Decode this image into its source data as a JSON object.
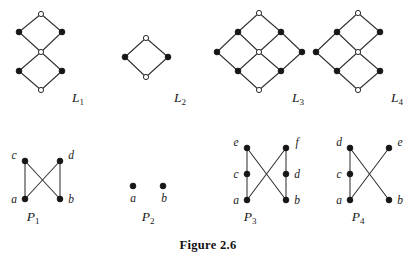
{
  "figure": {
    "caption": "Figure 2.6",
    "caption_x": 208,
    "caption_y": 249
  },
  "colors": {
    "filled_node": "#161616",
    "open_node_fill": "#ffffff",
    "open_node_stroke": "#2b2b2b",
    "edge": "#303030",
    "text": "#1a1a1a",
    "background": "#ffffff"
  },
  "diagrams": [
    {
      "id": "L1",
      "name": "lattice-l1",
      "label": {
        "base": "L",
        "sub": "1",
        "x": 78,
        "y": 102
      },
      "nodes": [
        {
          "id": "t",
          "x": 41,
          "y": 14,
          "type": "open"
        },
        {
          "id": "ul",
          "x": 19,
          "y": 32,
          "type": "filled"
        },
        {
          "id": "ur",
          "x": 62,
          "y": 32,
          "type": "filled"
        },
        {
          "id": "m",
          "x": 41,
          "y": 52,
          "type": "open"
        },
        {
          "id": "ll",
          "x": 19,
          "y": 71,
          "type": "filled"
        },
        {
          "id": "lr",
          "x": 62,
          "y": 71,
          "type": "filled"
        },
        {
          "id": "b",
          "x": 41,
          "y": 90,
          "type": "open"
        }
      ],
      "edges": [
        [
          "t",
          "ul"
        ],
        [
          "t",
          "ur"
        ],
        [
          "ul",
          "m"
        ],
        [
          "ur",
          "m"
        ],
        [
          "m",
          "ll"
        ],
        [
          "m",
          "lr"
        ],
        [
          "ll",
          "b"
        ],
        [
          "lr",
          "b"
        ]
      ],
      "vertex_labels": []
    },
    {
      "id": "L2",
      "name": "lattice-l2",
      "label": {
        "base": "L",
        "sub": "2",
        "x": 180,
        "y": 102
      },
      "nodes": [
        {
          "id": "t",
          "x": 146,
          "y": 38,
          "type": "open"
        },
        {
          "id": "l",
          "x": 125,
          "y": 57,
          "type": "filled"
        },
        {
          "id": "r",
          "x": 168,
          "y": 57,
          "type": "filled"
        },
        {
          "id": "b",
          "x": 146,
          "y": 77,
          "type": "open"
        }
      ],
      "edges": [
        [
          "t",
          "l"
        ],
        [
          "t",
          "r"
        ],
        [
          "l",
          "b"
        ],
        [
          "r",
          "b"
        ]
      ],
      "vertex_labels": []
    },
    {
      "id": "L3",
      "name": "lattice-l3",
      "label": {
        "base": "L",
        "sub": "3",
        "x": 298,
        "y": 102
      },
      "nodes": [
        {
          "id": "t",
          "x": 259,
          "y": 13,
          "type": "open"
        },
        {
          "id": "a1",
          "x": 238,
          "y": 32,
          "type": "filled"
        },
        {
          "id": "a2",
          "x": 281,
          "y": 32,
          "type": "filled"
        },
        {
          "id": "b1",
          "x": 217,
          "y": 52,
          "type": "filled"
        },
        {
          "id": "c",
          "x": 259,
          "y": 52,
          "type": "open"
        },
        {
          "id": "b2",
          "x": 302,
          "y": 52,
          "type": "filled"
        },
        {
          "id": "d1",
          "x": 238,
          "y": 71,
          "type": "filled"
        },
        {
          "id": "d2",
          "x": 281,
          "y": 71,
          "type": "filled"
        },
        {
          "id": "bt",
          "x": 259,
          "y": 90,
          "type": "open"
        }
      ],
      "edges": [
        [
          "t",
          "a1"
        ],
        [
          "t",
          "a2"
        ],
        [
          "a1",
          "b1"
        ],
        [
          "a1",
          "c"
        ],
        [
          "a2",
          "c"
        ],
        [
          "a2",
          "b2"
        ],
        [
          "b1",
          "d1"
        ],
        [
          "c",
          "d1"
        ],
        [
          "c",
          "d2"
        ],
        [
          "b2",
          "d2"
        ],
        [
          "d1",
          "bt"
        ],
        [
          "d2",
          "bt"
        ]
      ],
      "vertex_labels": []
    },
    {
      "id": "L4",
      "name": "lattice-l4",
      "label": {
        "base": "L",
        "sub": "4",
        "x": 397,
        "y": 102
      },
      "nodes": [
        {
          "id": "t",
          "x": 358,
          "y": 13,
          "type": "open"
        },
        {
          "id": "a1",
          "x": 337,
          "y": 32,
          "type": "filled"
        },
        {
          "id": "a2",
          "x": 380,
          "y": 32,
          "type": "filled"
        },
        {
          "id": "b1",
          "x": 316,
          "y": 52,
          "type": "filled"
        },
        {
          "id": "c",
          "x": 358,
          "y": 52,
          "type": "open"
        },
        {
          "id": "d1",
          "x": 337,
          "y": 71,
          "type": "filled"
        },
        {
          "id": "d2",
          "x": 380,
          "y": 71,
          "type": "filled"
        },
        {
          "id": "bt",
          "x": 358,
          "y": 90,
          "type": "open"
        }
      ],
      "edges": [
        [
          "t",
          "a1"
        ],
        [
          "t",
          "a2"
        ],
        [
          "a1",
          "b1"
        ],
        [
          "a1",
          "c"
        ],
        [
          "a2",
          "c"
        ],
        [
          "b1",
          "d1"
        ],
        [
          "c",
          "d1"
        ],
        [
          "c",
          "d2"
        ],
        [
          "d1",
          "bt"
        ],
        [
          "d2",
          "bt"
        ]
      ],
      "vertex_labels": []
    },
    {
      "id": "P1",
      "name": "poset-p1",
      "label": {
        "base": "P",
        "sub": "1",
        "x": 33,
        "y": 221
      },
      "nodes": [
        {
          "id": "c",
          "x": 25,
          "y": 161,
          "type": "filled"
        },
        {
          "id": "d",
          "x": 60,
          "y": 161,
          "type": "filled"
        },
        {
          "id": "a",
          "x": 25,
          "y": 199,
          "type": "filled"
        },
        {
          "id": "b",
          "x": 60,
          "y": 199,
          "type": "filled"
        }
      ],
      "edges": [
        [
          "a",
          "c"
        ],
        [
          "b",
          "d"
        ],
        [
          "a",
          "d"
        ],
        [
          "b",
          "c"
        ]
      ],
      "vertex_labels": [
        {
          "text": "c",
          "x": 14,
          "y": 159,
          "anchor": "middle"
        },
        {
          "text": "d",
          "x": 71,
          "y": 159,
          "anchor": "middle"
        },
        {
          "text": "a",
          "x": 14,
          "y": 203,
          "anchor": "middle"
        },
        {
          "text": "b",
          "x": 71,
          "y": 203,
          "anchor": "middle"
        }
      ]
    },
    {
      "id": "P2",
      "name": "poset-p2",
      "label": {
        "base": "P",
        "sub": "2",
        "x": 148,
        "y": 221
      },
      "nodes": [
        {
          "id": "a",
          "x": 133,
          "y": 186,
          "type": "filled"
        },
        {
          "id": "b",
          "x": 163,
          "y": 186,
          "type": "filled"
        }
      ],
      "edges": [],
      "vertex_labels": [
        {
          "text": "a",
          "x": 133,
          "y": 202,
          "anchor": "middle"
        },
        {
          "text": "b",
          "x": 164,
          "y": 202,
          "anchor": "middle"
        }
      ]
    },
    {
      "id": "P3",
      "name": "poset-p3",
      "label": {
        "base": "P",
        "sub": "3",
        "x": 250,
        "y": 221
      },
      "nodes": [
        {
          "id": "e",
          "x": 247,
          "y": 148,
          "type": "filled"
        },
        {
          "id": "f",
          "x": 286,
          "y": 148,
          "type": "filled"
        },
        {
          "id": "c",
          "x": 247,
          "y": 174,
          "type": "filled"
        },
        {
          "id": "d",
          "x": 286,
          "y": 174,
          "type": "filled"
        },
        {
          "id": "a",
          "x": 247,
          "y": 200,
          "type": "filled"
        },
        {
          "id": "b",
          "x": 286,
          "y": 200,
          "type": "filled"
        }
      ],
      "edges": [
        [
          "a",
          "c"
        ],
        [
          "c",
          "e"
        ],
        [
          "b",
          "d"
        ],
        [
          "d",
          "f"
        ],
        [
          "a",
          "f"
        ],
        [
          "b",
          "e"
        ]
      ],
      "vertex_labels": [
        {
          "text": "e",
          "x": 236,
          "y": 146,
          "anchor": "middle"
        },
        {
          "text": "f",
          "x": 297,
          "y": 146,
          "anchor": "middle"
        },
        {
          "text": "c",
          "x": 236,
          "y": 178,
          "anchor": "middle"
        },
        {
          "text": "d",
          "x": 297,
          "y": 178,
          "anchor": "middle"
        },
        {
          "text": "a",
          "x": 236,
          "y": 204,
          "anchor": "middle"
        },
        {
          "text": "b",
          "x": 297,
          "y": 204,
          "anchor": "middle"
        }
      ]
    },
    {
      "id": "P4",
      "name": "poset-p4",
      "label": {
        "base": "P",
        "sub": "4",
        "x": 358,
        "y": 221
      },
      "nodes": [
        {
          "id": "d",
          "x": 350,
          "y": 148,
          "type": "filled"
        },
        {
          "id": "e",
          "x": 389,
          "y": 148,
          "type": "filled"
        },
        {
          "id": "c",
          "x": 350,
          "y": 174,
          "type": "filled"
        },
        {
          "id": "a",
          "x": 350,
          "y": 200,
          "type": "filled"
        },
        {
          "id": "b",
          "x": 389,
          "y": 200,
          "type": "filled"
        }
      ],
      "edges": [
        [
          "a",
          "c"
        ],
        [
          "c",
          "d"
        ],
        [
          "a",
          "e"
        ],
        [
          "b",
          "d"
        ]
      ],
      "vertex_labels": [
        {
          "text": "d",
          "x": 339,
          "y": 146,
          "anchor": "middle"
        },
        {
          "text": "e",
          "x": 400,
          "y": 146,
          "anchor": "middle"
        },
        {
          "text": "c",
          "x": 339,
          "y": 178,
          "anchor": "middle"
        },
        {
          "text": "a",
          "x": 339,
          "y": 204,
          "anchor": "middle"
        },
        {
          "text": "b",
          "x": 400,
          "y": 204,
          "anchor": "middle"
        }
      ]
    }
  ]
}
